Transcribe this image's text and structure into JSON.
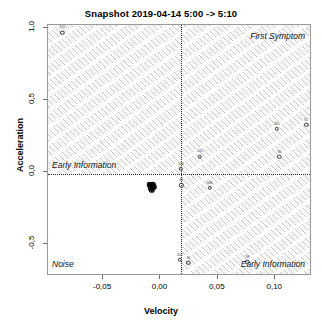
{
  "chart_data": {
    "type": "scatter",
    "title": "Snapshot 2019-04-14 5:00 -> 5:10",
    "xlabel": "Velocity",
    "ylabel": "Acceleration",
    "xlim": [
      -0.098,
      0.132
    ],
    "ylim": [
      -0.72,
      1.02
    ],
    "xticks": [
      -0.05,
      0.0,
      0.05,
      0.1
    ],
    "xticklabels": [
      "-0,05",
      "0,00",
      "0,05",
      "0,10"
    ],
    "yticks": [
      -0.5,
      0.0,
      0.5,
      1.0
    ],
    "yticklabels": [
      "-0,5",
      "0,0",
      "0,5",
      "1,0"
    ],
    "grid": false,
    "legend": null,
    "reference_lines": {
      "vertical_x": 0.018,
      "horizontal_y": 0.0,
      "style": "dotted"
    },
    "shaded_regions": {
      "style": "diagonal-hatch",
      "description": "Diagonal hatching fills all quadrants except the lower-left Noise quadrant"
    },
    "annotations": [
      {
        "text": "First Symptom",
        "position": "top-right",
        "style": "italic"
      },
      {
        "text": "Early Information",
        "position": "middle-left",
        "style": "italic"
      },
      {
        "text": "Noise",
        "position": "bottom-left",
        "style": "italic"
      },
      {
        "text": "Early Information",
        "position": "bottom-right",
        "style": "italic"
      }
    ],
    "points": [
      {
        "label": "515",
        "x": -0.0855,
        "y": 0.968
      },
      {
        "label": "338",
        "x": 0.0178,
        "y": 0.022
      },
      {
        "label": "611",
        "x": 0.0345,
        "y": 0.108
      },
      {
        "label": "301",
        "x": 0.1015,
        "y": 0.3
      },
      {
        "label": "62",
        "x": 0.127,
        "y": 0.327
      },
      {
        "label": "90",
        "x": 0.1035,
        "y": 0.105
      },
      {
        "label": "88",
        "x": 0.018,
        "y": -0.092
      },
      {
        "label": "686",
        "x": 0.043,
        "y": -0.108
      },
      {
        "label": "452",
        "x": 0.0168,
        "y": -0.608
      },
      {
        "label": "96",
        "x": 0.0243,
        "y": -0.628
      },
      {
        "label": "98",
        "x": 0.0755,
        "y": -0.622
      },
      {
        "label": "",
        "x": -0.0092,
        "y": -0.079,
        "cluster": true
      },
      {
        "label": "",
        "x": -0.0076,
        "y": -0.079,
        "cluster": true
      },
      {
        "label": "",
        "x": -0.0061,
        "y": -0.08,
        "cluster": true
      },
      {
        "label": "",
        "x": -0.0084,
        "y": -0.09,
        "cluster": true
      },
      {
        "label": "",
        "x": -0.0069,
        "y": -0.092,
        "cluster": true
      },
      {
        "label": "",
        "x": -0.01,
        "y": -0.096,
        "cluster": true
      },
      {
        "label": "",
        "x": -0.0079,
        "y": -0.103,
        "cluster": true
      },
      {
        "label": "",
        "x": -0.0063,
        "y": -0.104,
        "cluster": true
      },
      {
        "label": "",
        "x": -0.0091,
        "y": -0.112,
        "cluster": true
      },
      {
        "label": "",
        "x": -0.0072,
        "y": -0.116,
        "cluster": true
      },
      {
        "label": "",
        "x": -0.0055,
        "y": -0.11,
        "cluster": true
      },
      {
        "label": "",
        "x": -0.0086,
        "y": -0.125,
        "cluster": true
      },
      {
        "label": "",
        "x": -0.0068,
        "y": -0.128,
        "cluster": true
      },
      {
        "label": "",
        "x": -0.0104,
        "y": -0.085,
        "cluster": true
      },
      {
        "label": "",
        "x": -0.005,
        "y": -0.095,
        "cluster": true
      }
    ]
  }
}
